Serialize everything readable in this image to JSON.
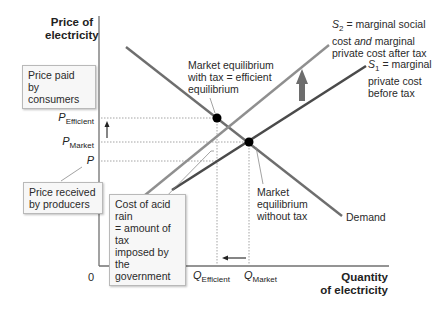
{
  "diagram": {
    "axes": {
      "y_label_line1": "Price of",
      "y_label_line2": "electricity",
      "x_label_line1": "Quantity",
      "x_label_line2": "of electricity",
      "origin": "0"
    },
    "price_ticks": {
      "p_efficient": {
        "main": "P",
        "sub": "Efficient"
      },
      "p_market": {
        "main": "P",
        "sub": "Market"
      },
      "p": {
        "main": "P"
      }
    },
    "quantity_ticks": {
      "q_efficient": {
        "main": "Q",
        "sub": "Efficient"
      },
      "q_market": {
        "main": "Q",
        "sub": "Market"
      }
    },
    "curves": {
      "s2": {
        "symbol": "S",
        "sub": "2",
        "line1_rest": " = marginal social",
        "line2_pre": "cost ",
        "line2_em": "and",
        "line2_post": " marginal",
        "line3": "private cost after tax",
        "color": "#8a8a8a"
      },
      "s1": {
        "symbol": "S",
        "sub": "1",
        "line1_rest": " = marginal",
        "line2": "private cost",
        "line3": "before tax",
        "color": "#4a4a4a"
      },
      "demand": {
        "label": "Demand",
        "color": "#6e6e6e"
      }
    },
    "annotations": {
      "efficient_eq": {
        "line1": "Market equilibrium",
        "line2": "with tax = efficient",
        "line3": "equilibrium"
      },
      "market_eq": {
        "line1": "Market",
        "line2": "equilibrium",
        "line3": "without tax"
      },
      "price_paid_box": {
        "line1": "Price paid",
        "line2": "by consumers"
      },
      "price_received_box": {
        "line1": "Price received",
        "line2": "by producers"
      },
      "acid_rain_box": {
        "line1": "Cost of acid rain",
        "line2": "= amount of tax",
        "line3": "imposed by the",
        "line4": "government"
      }
    },
    "arrows": {
      "supply_shift": "up",
      "price_change": "up",
      "quantity_change": "left"
    },
    "colors": {
      "axis": "#707070",
      "guide": "#9a9a9a",
      "shift_arrow": "#6d6d6d",
      "point": "#000000"
    }
  }
}
